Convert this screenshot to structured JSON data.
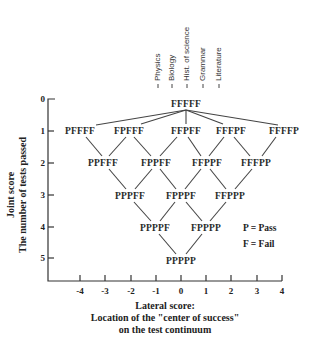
{
  "diagram": {
    "subjects": [
      "Physics",
      "Biology",
      "Hist. of science",
      "Grammar",
      "Literature"
    ],
    "y_axis": {
      "label_line1": "Joint score",
      "label_line2": "The number of tests passed",
      "ticks": [
        "0",
        "1",
        "2",
        "3",
        "4",
        "5"
      ]
    },
    "x_axis": {
      "label_line1": "Lateral score:",
      "label_line2": "Location of the \"center of success\"",
      "label_line3": "on the test continuum",
      "ticks": [
        "-4",
        "-3",
        "-2",
        "-1",
        "0",
        "1",
        "2",
        "3",
        "4"
      ]
    },
    "legend": {
      "pass": "P = Pass",
      "fail": "F = Fail"
    },
    "nodes": {
      "r0": [
        "FFFFF"
      ],
      "r1": [
        "PFFFF",
        "FPFFF",
        "FFPFF",
        "FFFPF",
        "FFFFP"
      ],
      "r2": [
        "PPFFF",
        "FPPFF",
        "FFPPF",
        "FFFPP"
      ],
      "r3": [
        "PPPFF",
        "FPPPF",
        "FFPPP"
      ],
      "r4": [
        "PPPPF",
        "FPPPP"
      ],
      "r5": [
        "PPPPP"
      ]
    },
    "edges": [
      [
        "FFFFF",
        "PFFFF"
      ],
      [
        "FFFFF",
        "FPFFF"
      ],
      [
        "FFFFF",
        "FFPFF"
      ],
      [
        "FFFFF",
        "FFFPF"
      ],
      [
        "FFFFF",
        "FFFFP"
      ],
      [
        "PFFFF",
        "PPFFF"
      ],
      [
        "FPFFF",
        "PPFFF"
      ],
      [
        "FPFFF",
        "FPPFF"
      ],
      [
        "FFPFF",
        "FPPFF"
      ],
      [
        "FFPFF",
        "FFPPF"
      ],
      [
        "FFFPF",
        "FFPPF"
      ],
      [
        "FFFPF",
        "FFFPP"
      ],
      [
        "FFFFP",
        "FFFPP"
      ],
      [
        "PPFFF",
        "PPPFF"
      ],
      [
        "FPPFF",
        "PPPFF"
      ],
      [
        "FPPFF",
        "FPPPF"
      ],
      [
        "FFPPF",
        "FPPPF"
      ],
      [
        "FFPPF",
        "FFPPP"
      ],
      [
        "FFFPP",
        "FFPPP"
      ],
      [
        "PPPFF",
        "PPPPF"
      ],
      [
        "FPPPF",
        "PPPPF"
      ],
      [
        "FPPPF",
        "FPPPP"
      ],
      [
        "FFPPP",
        "FPPPP"
      ],
      [
        "PPPPF",
        "PPPPP"
      ],
      [
        "FPPPP",
        "PPPPP"
      ]
    ]
  }
}
